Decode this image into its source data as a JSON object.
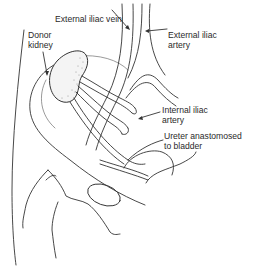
{
  "diagram": {
    "type": "anatomical-illustration",
    "labels": {
      "donor_kidney": "Donor\nkidney",
      "external_iliac_vein": "External iliac vein",
      "external_iliac_artery": "External iliac\nartery",
      "internal_iliac_artery": "Internal iliac\nartery",
      "ureter": "Ureter anastomosed\nto bladder"
    },
    "colors": {
      "line": "#333333",
      "text": "#2a2a2a",
      "background": "#ffffff"
    }
  }
}
